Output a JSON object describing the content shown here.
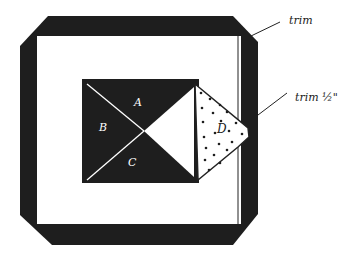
{
  "diagram": {
    "title": "",
    "colors": {
      "fabric_dark": "#1e1e1e",
      "background": "#ffffff",
      "line": "#222222",
      "dots": "#1e1e1e"
    },
    "pieces": {
      "A": "A",
      "B": "B",
      "C": "C",
      "D": "D"
    },
    "annotations": {
      "trim_corner": "trim",
      "trim_half": "trim ½\""
    }
  }
}
